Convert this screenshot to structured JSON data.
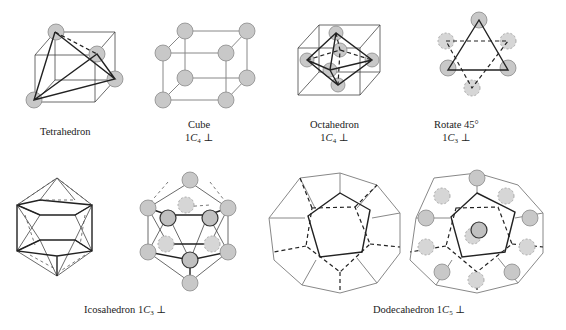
{
  "figure": {
    "panels": [
      {
        "id": "tetrahedron",
        "label": "Tetrahedron",
        "symmetry": ""
      },
      {
        "id": "cube",
        "label": "Cube",
        "symmetry_prefix": "1",
        "symmetry_axis": "C",
        "symmetry_sub": "4",
        "symmetry_suffix": "⊥"
      },
      {
        "id": "octahedron",
        "label": "Octahedron",
        "symmetry_prefix": "1",
        "symmetry_axis": "C",
        "symmetry_sub": "4",
        "symmetry_suffix": "⊥"
      },
      {
        "id": "rotate",
        "label": "Rotate 45°",
        "symmetry_prefix": "1",
        "symmetry_axis": "C",
        "symmetry_sub": "3",
        "symmetry_suffix": "⊥"
      },
      {
        "id": "icosahedron",
        "label": "Icosahedron 1",
        "symmetry_axis": "C",
        "symmetry_sub": "3",
        "symmetry_suffix": "⊥"
      },
      {
        "id": "dodecahedron",
        "label": "Dodecahedron 1",
        "symmetry_axis": "C",
        "symmetry_sub": "5",
        "symmetry_suffix": "⊥"
      }
    ],
    "colors": {
      "atom_fill": "#c8c8c8",
      "atom_stroke": "#8a8a8a",
      "edge": "#222222",
      "light_edge": "#888888"
    }
  }
}
